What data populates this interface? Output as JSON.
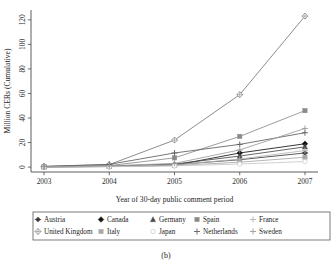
{
  "figure": {
    "caption": "(b)",
    "panel_label": "(b)"
  },
  "chart_data": {
    "type": "line",
    "title": "",
    "subtitle": "",
    "xlabel": "Year of 30-day public comment period",
    "ylabel": "Million CERs (Cumulative)",
    "x": [
      2003,
      2004,
      2005,
      2006,
      2007
    ],
    "xtick_labels": [
      "2003",
      "2004",
      "2005",
      "2006",
      "2007"
    ],
    "ytick_labels": [
      "0",
      "20",
      "40",
      "60",
      "80",
      "100",
      "120"
    ],
    "yticks": [
      0,
      20,
      40,
      60,
      80,
      100,
      120
    ],
    "ylim": [
      -4,
      128
    ],
    "xlim": [
      2002.8,
      2007.2
    ],
    "grid": false,
    "legend_position": "bottom",
    "legend_columns": 5,
    "legend_rows": 2,
    "series": [
      {
        "name": "Austria",
        "marker": "filled-plus-diamond",
        "color": "#3d3d3d",
        "values": [
          0.2,
          0.6,
          2.0,
          6.0,
          11.5
        ]
      },
      {
        "name": "Canada",
        "marker": "filled-diamond",
        "color": "#141414",
        "values": [
          0.2,
          0.5,
          1.5,
          11.5,
          19.0
        ]
      },
      {
        "name": "Germany",
        "marker": "filled-triangle",
        "color": "#4a4a4a",
        "values": [
          0.3,
          0.8,
          2.5,
          9.0,
          16.5
        ]
      },
      {
        "name": "Spain",
        "marker": "filled-square",
        "color": "#8a8a8a",
        "values": [
          0.4,
          1.2,
          7.5,
          25.0,
          46.0
        ]
      },
      {
        "name": "France",
        "marker": "light-plus",
        "color": "#b4b4b4",
        "values": [
          0.2,
          0.5,
          1.8,
          6.5,
          13.5
        ]
      },
      {
        "name": "United Kingdom",
        "marker": "open-diamond",
        "color": "#777777",
        "values": [
          0.5,
          2.0,
          22.0,
          59.0,
          123.0
        ]
      },
      {
        "name": "Italy",
        "marker": "light-square",
        "color": "#a8a8a8",
        "values": [
          0.1,
          0.4,
          1.2,
          4.0,
          8.0
        ]
      },
      {
        "name": "Japan",
        "marker": "open-circle",
        "color": "#c8c8c8",
        "values": [
          0.1,
          0.3,
          1.0,
          2.5,
          4.5
        ]
      },
      {
        "name": "Netherlands",
        "marker": "plus",
        "color": "#5f5f5f",
        "values": [
          0.6,
          2.2,
          11.5,
          18.5,
          28.0
        ]
      },
      {
        "name": "Sweden",
        "marker": "light-cross",
        "color": "#9c9c9c",
        "values": [
          0.3,
          1.0,
          3.0,
          14.0,
          31.5
        ]
      }
    ]
  }
}
